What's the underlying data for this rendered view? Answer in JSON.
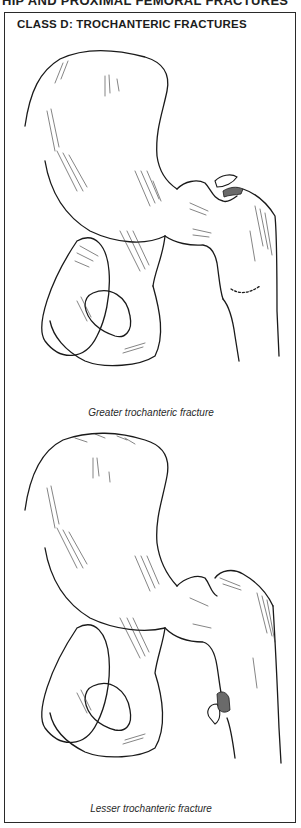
{
  "running_header": "HIP AND PROXIMAL FEMORAL FRACTURES",
  "panel": {
    "title": "CLASS D: TROCHANTERIC FRACTURES",
    "figures": [
      {
        "caption": "Greater trochanteric fracture",
        "illustration": "pelvis-femur-greater-trochanter-avulsion"
      },
      {
        "caption": "Lesser trochanteric fracture",
        "illustration": "pelvis-femur-lesser-trochanter-avulsion"
      }
    ]
  },
  "colors": {
    "ink": "#1a1a1a",
    "background": "#ffffff",
    "border": "#2a2a2a"
  }
}
